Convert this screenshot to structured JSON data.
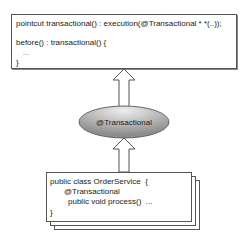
{
  "diagram": {
    "aspect_box": {
      "lines": [
        "pointcut transactional() : execution(@Transactional * *(..));",
        "before() : transactional() {",
        "   ...",
        "}"
      ]
    },
    "annotation_node": {
      "label": "@Transactional",
      "fill_light": "#e6e6e6",
      "fill_dark": "#8f8f8f"
    },
    "class_box": {
      "lines": [
        "public class OrderService  {",
        "@Transactional",
        "public void process()  ..."
      ],
      "closing": "}"
    },
    "colors": {
      "border": "#555555",
      "arrow": "#555555",
      "background": "#ffffff"
    }
  }
}
